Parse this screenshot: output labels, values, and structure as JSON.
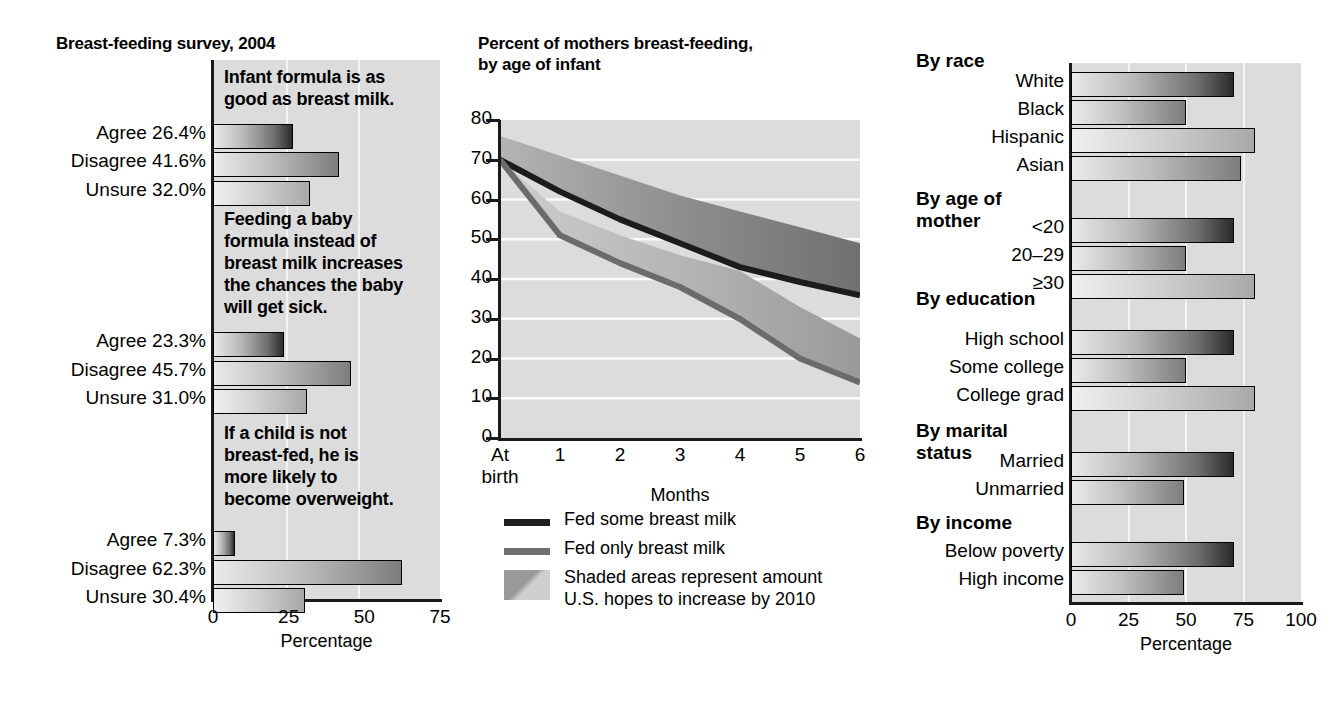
{
  "left": {
    "title": "Breast-feeding survey, 2004",
    "axis": {
      "ticks": [
        "0",
        "25",
        "50",
        "75"
      ],
      "title": "Percentage",
      "min": 0,
      "max": 75
    },
    "groups": [
      {
        "question": "Infant formula is as\ngood as breast milk.",
        "rows": [
          {
            "label": "Agree 26.4%",
            "value": 26.4
          },
          {
            "label": "Disagree 41.6%",
            "value": 41.6
          },
          {
            "label": "Unsure 32.0%",
            "value": 32.0
          }
        ]
      },
      {
        "question": "Feeding a baby\nformula instead of\nbreast milk increases\nthe chances the baby\nwill get sick.",
        "rows": [
          {
            "label": "Agree 23.3%",
            "value": 23.3
          },
          {
            "label": "Disagree 45.7%",
            "value": 45.7
          },
          {
            "label": "Unsure 31.0%",
            "value": 31.0
          }
        ]
      },
      {
        "question": "If a child is not\nbreast-fed, he is\nmore likely to\nbecome overweight.",
        "rows": [
          {
            "label": "Agree 7.3%",
            "value": 7.3
          },
          {
            "label": "Disagree 62.3%",
            "value": 62.3
          },
          {
            "label": "Unsure 30.4%",
            "value": 30.4
          }
        ]
      }
    ]
  },
  "center": {
    "title": "Percent of mothers breast-feeding,\nby age of infant",
    "legend": [
      {
        "icon": "dark-line-swatch",
        "text": "Fed some breast milk"
      },
      {
        "icon": "gray-line-swatch",
        "text": "Fed only breast milk"
      },
      {
        "icon": "shaded-area-swatch",
        "text": "Shaded areas represent amount\nU.S. hopes to increase by 2010"
      }
    ]
  },
  "right": {
    "axis": {
      "ticks": [
        "0",
        "25",
        "50",
        "75",
        "100"
      ],
      "title": "Percentage",
      "min": 0,
      "max": 100
    },
    "groups": [
      {
        "head": "By race",
        "rows": [
          {
            "label": "White",
            "value": 71
          },
          {
            "label": "Black",
            "value": 50
          },
          {
            "label": "Hispanic",
            "value": 80
          },
          {
            "label": "Asian",
            "value": 74
          }
        ]
      },
      {
        "head": "By age of\nmother",
        "rows": [
          {
            "label": "<20",
            "value": 71
          },
          {
            "label": "20–29",
            "value": 50
          },
          {
            "label": "≥30",
            "value": 80
          }
        ]
      },
      {
        "head": "By education",
        "rows": [
          {
            "label": "High school",
            "value": 71
          },
          {
            "label": "Some college",
            "value": 50
          },
          {
            "label": "College grad",
            "value": 80
          }
        ]
      },
      {
        "head": "By marital\nstatus",
        "rows": [
          {
            "label": "Married",
            "value": 71
          },
          {
            "label": "Unmarried",
            "value": 49
          }
        ]
      },
      {
        "head": "By income",
        "rows": [
          {
            "label": "Below poverty",
            "value": 71
          },
          {
            "label": "High income",
            "value": 49
          }
        ]
      }
    ]
  },
  "chart_data": [
    {
      "type": "bar",
      "title": "Breast-feeding survey, 2004",
      "orientation": "horizontal",
      "xlabel": "Percentage",
      "ylabel": "",
      "xlim": [
        0,
        75
      ],
      "xticks": [
        0,
        25,
        50,
        75
      ],
      "grid": true,
      "panels": [
        {
          "question": "Infant formula is as good as breast milk.",
          "categories": [
            "Agree",
            "Disagree",
            "Unsure"
          ],
          "values": [
            26.4,
            41.6,
            32.0
          ]
        },
        {
          "question": "Feeding a baby formula instead of breast milk increases the chances the baby will get sick.",
          "categories": [
            "Agree",
            "Disagree",
            "Unsure"
          ],
          "values": [
            23.3,
            45.7,
            31.0
          ]
        },
        {
          "question": "If a child is not breast-fed, he is more likely to become overweight.",
          "categories": [
            "Agree",
            "Disagree",
            "Unsure"
          ],
          "values": [
            7.3,
            62.3,
            30.4
          ]
        }
      ]
    },
    {
      "type": "area",
      "title": "Percent of mothers breast-feeding, by age of infant",
      "xlabel": "Months",
      "ylabel": "",
      "x": [
        "At birth",
        "1",
        "2",
        "3",
        "4",
        "5",
        "6"
      ],
      "xlim": [
        0,
        6
      ],
      "ylim": [
        0,
        80
      ],
      "yticks": [
        0,
        10,
        20,
        30,
        40,
        50,
        60,
        70,
        80
      ],
      "grid": true,
      "legend_position": "below",
      "series": [
        {
          "name": "Fed some breast milk",
          "values": [
            70,
            62,
            55,
            49,
            43,
            39,
            36
          ]
        },
        {
          "name": "Fed some breast milk — 2010 goal (upper band edge)",
          "values": [
            76,
            71,
            66,
            61,
            57,
            53,
            49
          ]
        },
        {
          "name": "Fed only breast milk",
          "values": [
            70,
            51,
            44,
            38,
            30,
            20,
            14
          ]
        },
        {
          "name": "Fed only breast milk — 2010 goal (upper band edge)",
          "values": [
            70,
            57,
            51,
            46,
            42,
            33,
            25
          ]
        }
      ],
      "annotations": [
        "Shaded areas represent amount U.S. hopes to increase by 2010"
      ]
    },
    {
      "type": "bar",
      "title": "",
      "orientation": "horizontal",
      "xlabel": "Percentage",
      "xlim": [
        0,
        100
      ],
      "xticks": [
        0,
        25,
        50,
        75,
        100
      ],
      "grid": true,
      "panels": [
        {
          "group": "By race",
          "categories": [
            "White",
            "Black",
            "Hispanic",
            "Asian"
          ],
          "values": [
            71,
            50,
            80,
            74
          ]
        },
        {
          "group": "By age of mother",
          "categories": [
            "<20",
            "20–29",
            "≥30"
          ],
          "values": [
            71,
            50,
            80
          ]
        },
        {
          "group": "By education",
          "categories": [
            "High school",
            "Some college",
            "College grad"
          ],
          "values": [
            71,
            50,
            80
          ]
        },
        {
          "group": "By marital status",
          "categories": [
            "Married",
            "Unmarried"
          ],
          "values": [
            71,
            49
          ]
        },
        {
          "group": "By income",
          "categories": [
            "Below poverty",
            "High income"
          ],
          "values": [
            71,
            49
          ]
        }
      ]
    }
  ]
}
